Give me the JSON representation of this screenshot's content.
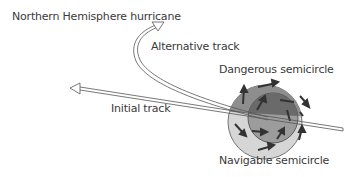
{
  "diagram": {
    "title": "Northern Hemisphere hurricane",
    "labels": {
      "alternative_track": "Alternative track",
      "initial_track": "Initial track",
      "dangerous_semicircle": "Dangerous semicircle",
      "navigable_semicircle": "Navigable semicircle"
    },
    "colors": {
      "outer_circle_dark": "#8a8a8a",
      "outer_circle_light": "#d4d4d4",
      "inner_circle": "#6e6e6e",
      "inner_circle_lower": "#9a9a9a",
      "arrows": "#3a3a3a",
      "track_outline": "#666666",
      "text": "#3a3a3a"
    }
  }
}
